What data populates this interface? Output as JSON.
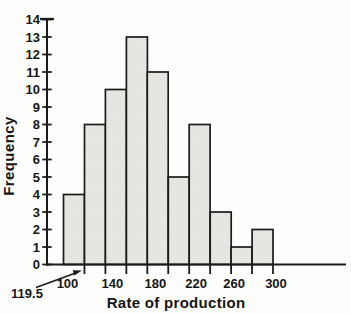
{
  "chart_data": {
    "type": "bar",
    "subtype": "histogram",
    "title": "",
    "xlabel": "Rate of production",
    "ylabel": "Frequency",
    "bin_edges": [
      100,
      120,
      140,
      160,
      180,
      200,
      220,
      240,
      260,
      280,
      300
    ],
    "values": [
      4,
      8,
      10,
      13,
      11,
      5,
      8,
      3,
      1,
      2
    ],
    "y_ticks": [
      0,
      1,
      2,
      3,
      4,
      5,
      6,
      7,
      8,
      9,
      10,
      11,
      12,
      13,
      14
    ],
    "ylim": [
      0,
      14
    ],
    "x_tick_labels": [
      "100",
      "140",
      "180",
      "220",
      "260",
      "300"
    ],
    "x_tick_label_values": [
      100,
      140,
      180,
      220,
      260,
      300
    ],
    "grid": false,
    "legend": "none",
    "annotation": {
      "text": "119.5",
      "points_to_x": 119.5,
      "meaning": "arrow marks the first class boundary on the x-axis"
    },
    "colors": {
      "line": "#1b1b1b",
      "text": "#161616",
      "bar_fill_base": "#eeedea",
      "bar_fill_dot": "#dcdbd7",
      "background": "#fdfdfb"
    }
  }
}
